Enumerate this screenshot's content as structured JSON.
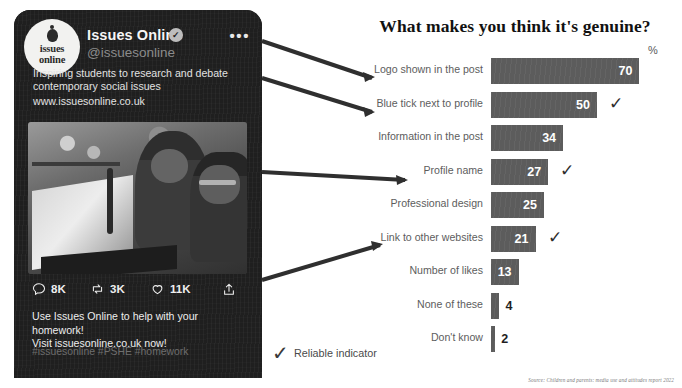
{
  "tweet_card": {
    "display_name": "Issues Online",
    "verified_icon": "verified-badge-icon",
    "more_menu": "•••",
    "handle": "@issuesonline",
    "bio": "Inspiring students to research and debate contemporary social issues",
    "bio_url": "www.issuesonline.co.uk",
    "avatar": {
      "line1": "issues",
      "line2": "online"
    },
    "actions": [
      {
        "name": "reply",
        "icon": "reply-icon",
        "count": "8K"
      },
      {
        "name": "retweet",
        "icon": "retweet-icon",
        "count": "3K"
      },
      {
        "name": "like",
        "icon": "heart-icon",
        "count": "11K"
      },
      {
        "name": "share",
        "icon": "share-icon",
        "count": ""
      }
    ],
    "tweet_text_line1": "Use Issues Online to help with your homework!",
    "tweet_text_line2": "Visit issuesonline.co.uk now!",
    "hashtags": "#issuesonline #PSHE #homework"
  },
  "chart_data": {
    "type": "bar",
    "orientation": "horizontal",
    "title": "What makes you think it's genuine?",
    "xlabel": "%",
    "ylabel": "",
    "xlim": [
      0,
      70
    ],
    "grid": false,
    "legend": "Reliable indicator",
    "unit_symbol": "%",
    "bar_color": "#5c5c5c",
    "categories": [
      "Logo shown in the post",
      "Blue tick next to profile",
      "Information in the post",
      "Profile name",
      "Professional design",
      "Link to other websites",
      "Number of likes",
      "None of these",
      "Don't know"
    ],
    "values": [
      70,
      50,
      34,
      27,
      25,
      21,
      13,
      4,
      2
    ],
    "reliable_indicator": [
      false,
      true,
      false,
      true,
      false,
      true,
      false,
      false,
      false
    ],
    "value_outside": [
      false,
      false,
      false,
      false,
      false,
      false,
      false,
      true,
      true
    ],
    "source": "Source: Children and parents: media use and attitudes report 2022"
  }
}
